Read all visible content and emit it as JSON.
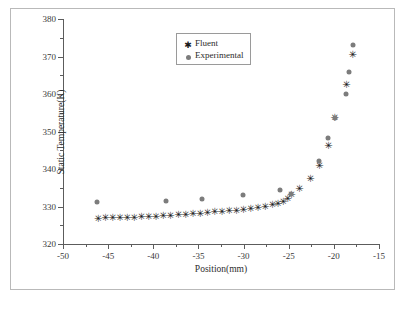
{
  "chart_data": {
    "type": "scatter",
    "title": "",
    "xlabel": "Position(mm)",
    "ylabel": "Static Temperature(K)",
    "xlim": [
      -50,
      -15
    ],
    "ylim": [
      320,
      380
    ],
    "xticks": [
      -50,
      -45,
      -40,
      -35,
      -30,
      -25,
      -20,
      -15
    ],
    "yticks": [
      320,
      330,
      340,
      350,
      360,
      370,
      380
    ],
    "xtick_labels": [
      "-50",
      "-45",
      "-40",
      "-35",
      "-30",
      "-25",
      "-20",
      "-15"
    ],
    "ytick_labels": [
      "320",
      "330",
      "340",
      "350",
      "360",
      "370",
      "380"
    ],
    "x_minor_step": 2.5,
    "y_minor_step": 5,
    "grid": false,
    "legend_position": "top-center",
    "series": [
      {
        "name": "Fluent",
        "marker": "star",
        "color": "#1a1a1a",
        "points": [
          [
            -46.1,
            327.0
          ],
          [
            -45.3,
            327.1
          ],
          [
            -44.5,
            327.1
          ],
          [
            -43.7,
            327.2
          ],
          [
            -42.9,
            327.2
          ],
          [
            -42.1,
            327.3
          ],
          [
            -41.3,
            327.4
          ],
          [
            -40.5,
            327.5
          ],
          [
            -39.7,
            327.6
          ],
          [
            -38.9,
            327.7
          ],
          [
            -38.1,
            327.8
          ],
          [
            -37.2,
            327.9
          ],
          [
            -36.4,
            328.1
          ],
          [
            -35.6,
            328.3
          ],
          [
            -34.8,
            328.4
          ],
          [
            -34.0,
            328.6
          ],
          [
            -33.2,
            328.7
          ],
          [
            -32.4,
            328.9
          ],
          [
            -31.6,
            329.0
          ],
          [
            -30.8,
            329.2
          ],
          [
            -30.0,
            329.4
          ],
          [
            -29.2,
            329.6
          ],
          [
            -28.4,
            329.9
          ],
          [
            -27.6,
            330.2
          ],
          [
            -26.8,
            330.6
          ],
          [
            -26.2,
            331.0
          ],
          [
            -25.6,
            331.6
          ],
          [
            -25.1,
            332.2
          ],
          [
            -24.7,
            333.3
          ],
          [
            -23.8,
            335.0
          ],
          [
            -22.6,
            337.5
          ],
          [
            -21.6,
            341.2
          ],
          [
            -20.6,
            346.5
          ],
          [
            -19.9,
            353.8
          ],
          [
            -18.6,
            362.6
          ],
          [
            -17.9,
            370.8
          ]
        ]
      },
      {
        "name": "Experimental",
        "marker": "circle",
        "color": "#7c7c7c",
        "points": [
          [
            -46.2,
            331.3
          ],
          [
            -38.6,
            331.4
          ],
          [
            -34.6,
            331.9
          ],
          [
            -30.1,
            333.1
          ],
          [
            -26.0,
            334.4
          ],
          [
            -24.8,
            333.3
          ],
          [
            -21.6,
            342.1
          ],
          [
            -20.6,
            348.2
          ],
          [
            -19.9,
            353.7
          ],
          [
            -18.6,
            359.9
          ],
          [
            -18.3,
            366.0
          ],
          [
            -17.9,
            373.0
          ]
        ]
      }
    ],
    "legend": [
      {
        "label": "Fluent",
        "marker": "star",
        "color": "#1a1a1a"
      },
      {
        "label": "Experimental",
        "marker": "circle",
        "color": "#7c7c7c"
      }
    ]
  }
}
